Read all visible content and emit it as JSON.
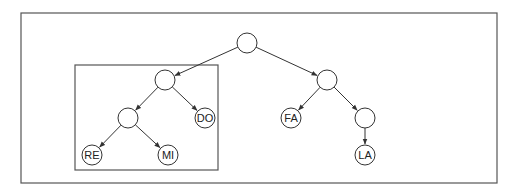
{
  "diagram": {
    "type": "tree",
    "outer_box": {
      "x": 21,
      "y": 13,
      "w": 476,
      "h": 170
    },
    "subtree_box": {
      "x": 75,
      "y": 65,
      "w": 143,
      "h": 105
    },
    "node_radius": 10,
    "nodes": [
      {
        "id": "root",
        "label": "",
        "x": 247,
        "y": 43
      },
      {
        "id": "n1",
        "label": "",
        "x": 165,
        "y": 80
      },
      {
        "id": "n2",
        "label": "",
        "x": 128,
        "y": 118
      },
      {
        "id": "do",
        "label": "DO",
        "x": 205,
        "y": 118
      },
      {
        "id": "re",
        "label": "RE",
        "x": 92,
        "y": 155
      },
      {
        "id": "mi",
        "label": "MI",
        "x": 168,
        "y": 155
      },
      {
        "id": "n3",
        "label": "",
        "x": 327,
        "y": 80
      },
      {
        "id": "fa",
        "label": "FA",
        "x": 291,
        "y": 118
      },
      {
        "id": "n4",
        "label": "",
        "x": 365,
        "y": 118
      },
      {
        "id": "la",
        "label": "LA",
        "x": 365,
        "y": 155
      }
    ],
    "edges": [
      [
        "root",
        "n1"
      ],
      [
        "root",
        "n3"
      ],
      [
        "n1",
        "n2"
      ],
      [
        "n1",
        "do"
      ],
      [
        "n2",
        "re"
      ],
      [
        "n2",
        "mi"
      ],
      [
        "n3",
        "fa"
      ],
      [
        "n3",
        "n4"
      ],
      [
        "n4",
        "la"
      ]
    ],
    "colors": {
      "stroke": "#333333",
      "box": "#555555",
      "background": "#ffffff"
    }
  }
}
